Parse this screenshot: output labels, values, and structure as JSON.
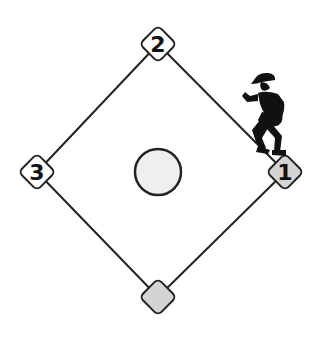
{
  "diagram": {
    "type": "baseball-diamond",
    "bases": [
      {
        "id": "first",
        "label": "1",
        "fill": "#d4d4d4",
        "occupied": true
      },
      {
        "id": "second",
        "label": "2",
        "fill": "#ffffff",
        "occupied": false
      },
      {
        "id": "third",
        "label": "3",
        "fill": "#ffffff",
        "occupied": false
      },
      {
        "id": "home",
        "label": "",
        "fill": "#d4d4d4",
        "occupied": false
      }
    ],
    "pitchers_mound": {
      "fill": "#efefef"
    },
    "runner": {
      "icon": "baseball-runner-icon",
      "on_base": "1"
    },
    "colors": {
      "line": "#222222",
      "occupied_base": "#d4d4d4",
      "empty_base": "#ffffff"
    }
  }
}
